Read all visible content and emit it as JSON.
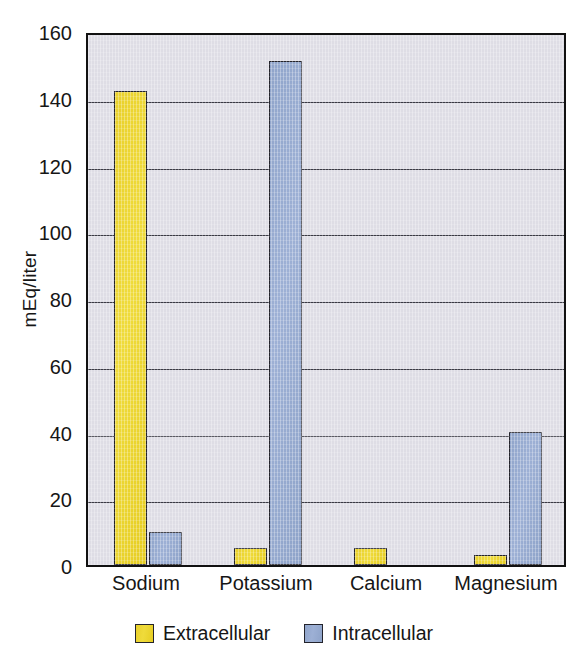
{
  "chart_data": {
    "type": "bar",
    "title": "",
    "xlabel": "",
    "ylabel": "mEq/liter",
    "ylim": [
      0,
      160
    ],
    "yticks": [
      0,
      20,
      40,
      60,
      80,
      100,
      120,
      140,
      160
    ],
    "ytick_labels": [
      "0",
      "20",
      "40",
      "60",
      "80",
      "100",
      "120",
      "140",
      "160"
    ],
    "grid": true,
    "legend_position": "bottom-center",
    "categories": [
      "Sodium",
      "Potassium",
      "Calcium",
      "Magnesium"
    ],
    "series": [
      {
        "name": "Extracellular",
        "color": "#ecd72c",
        "values": [
          142,
          5,
          5,
          3
        ]
      },
      {
        "name": "Intracellular",
        "color": "#92a8ce",
        "values": [
          10,
          151,
          0,
          40
        ]
      }
    ]
  },
  "legend": {
    "items": [
      {
        "label": "Extracellular",
        "swatch": "extracellular-swatch"
      },
      {
        "label": "Intracellular",
        "swatch": "intracellular-swatch"
      }
    ]
  },
  "colors": {
    "extracellular": "#ecd72c",
    "intracellular": "#92a8ce",
    "plot_background": "#deddE5",
    "axis": "#111111",
    "gridline": "#3a3a44",
    "text": "#161616"
  }
}
